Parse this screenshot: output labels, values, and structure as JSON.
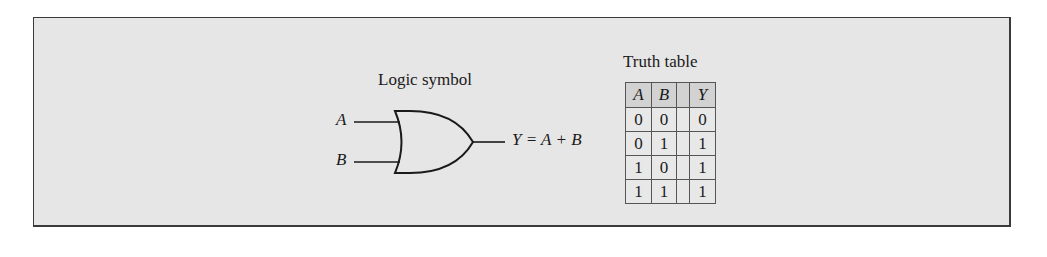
{
  "logic_symbol": {
    "title": "Logic symbol",
    "inputs": [
      "A",
      "B"
    ],
    "output_label": "Y = A + B",
    "gate_type": "OR"
  },
  "truth_table": {
    "title": "Truth table",
    "headers": [
      "A",
      "B",
      "",
      "Y"
    ],
    "rows": [
      [
        "0",
        "0",
        "",
        "0"
      ],
      [
        "0",
        "1",
        "",
        "1"
      ],
      [
        "1",
        "0",
        "",
        "1"
      ],
      [
        "1",
        "1",
        "",
        "1"
      ]
    ]
  }
}
